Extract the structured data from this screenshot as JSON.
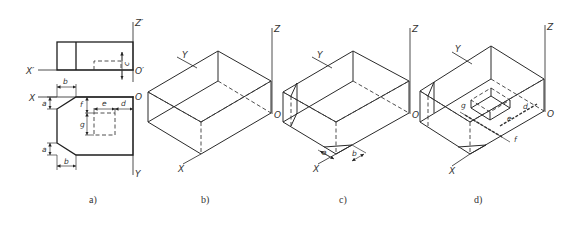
{
  "figure": {
    "panels": [
      {
        "id": "a",
        "caption": "a)",
        "type": "orthographic-views",
        "front_view_axes": {
          "x": "X'",
          "z": "Z'",
          "origin": "O'"
        },
        "top_view_axes": {
          "x": "X",
          "y": "Y",
          "origin": "O"
        },
        "dimensions": [
          "a",
          "b",
          "c",
          "d",
          "e",
          "f",
          "g",
          "a",
          "b"
        ]
      },
      {
        "id": "b",
        "caption": "b)",
        "type": "isometric-box",
        "axes": {
          "x": "X",
          "y": "Y",
          "z": "Z",
          "origin": "O"
        }
      },
      {
        "id": "c",
        "caption": "c)",
        "type": "isometric-box-with-chamfers",
        "axes": {
          "x": "X",
          "y": "Y",
          "z": "Z",
          "origin": "O"
        },
        "dimensions": [
          "a",
          "b"
        ]
      },
      {
        "id": "d",
        "caption": "d)",
        "type": "isometric-box-with-recess",
        "axes": {
          "x": "X",
          "y": "Y",
          "z": "Z",
          "origin": "O"
        },
        "dimensions": [
          "g",
          "e",
          "d",
          "f"
        ]
      }
    ]
  }
}
